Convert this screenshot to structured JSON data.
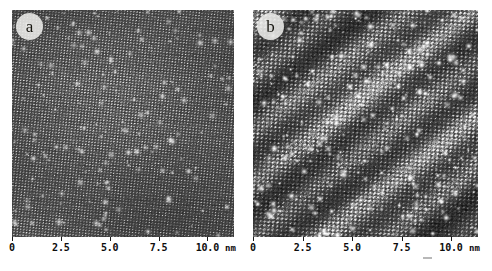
{
  "figure": {
    "background_color": "#ffffff",
    "panel_count": 2
  },
  "panels": [
    {
      "id": "a",
      "label": "a",
      "description": "Atomically resolved scanning tunneling microscopy image showing a fine uniform lattice with rows tilted slightly upward to the right and scattered small bright protrusions.",
      "texture": {
        "style": "fine-lattice",
        "base_gray": "#4d4d4d",
        "dark_gray": "#1e1e1e",
        "bright_gray": "#e6e6e6",
        "lattice_period_px": 3.1,
        "row_tilt_deg": -6,
        "grain": 0.55,
        "defect_count": 150,
        "defect_brightness": 0.75,
        "band_count": 0
      }
    },
    {
      "id": "b",
      "label": "b",
      "description": "Scanning tunneling microscopy image of the same surface showing a coarser corrugated lattice, many bright point defects, and broad diagonal stripe domains running from lower-left to upper-right.",
      "texture": {
        "style": "coarse-lattice",
        "base_gray": "#4a4a4a",
        "dark_gray": "#161616",
        "bright_gray": "#f2f2f2",
        "lattice_period_px": 4.3,
        "row_tilt_deg": -4,
        "grain": 0.8,
        "defect_count": 230,
        "defect_brightness": 1.0,
        "band_count": 7,
        "band_angle_deg": -52,
        "band_spacing_px": 42,
        "band_contrast": 0.3
      }
    }
  ],
  "axis": {
    "unit": "nm",
    "ticks": [
      {
        "label": "0",
        "value": 0,
        "pos_pct": 0
      },
      {
        "label": "2.5",
        "value": 2.5,
        "pos_pct": 22
      },
      {
        "label": "5.0",
        "value": 5.0,
        "pos_pct": 44
      },
      {
        "label": "7.5",
        "value": 7.5,
        "pos_pct": 66
      },
      {
        "label": "10.0",
        "value": 10.0,
        "pos_pct": 88
      }
    ],
    "range_nm": [
      0,
      11.4
    ],
    "unit_pos_pct": 96
  }
}
